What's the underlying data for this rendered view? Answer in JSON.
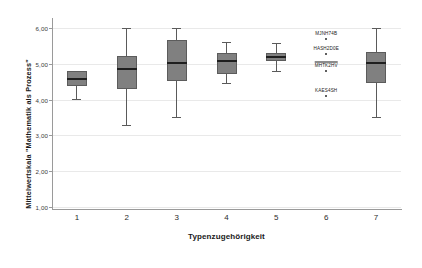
{
  "chart_data": {
    "type": "box",
    "title": "",
    "xlabel": "Typenzugehörigkeit",
    "ylabel": "Mittelwertskala \"Mathematik als Prozess\"",
    "categories": [
      "1",
      "2",
      "3",
      "4",
      "5",
      "6",
      "7"
    ],
    "ytick_labels": [
      "6,00",
      "5,00",
      "4,00",
      "3,00",
      "2,00",
      "1,00"
    ],
    "ytick_values": [
      6.0,
      5.0,
      4.0,
      3.0,
      2.0,
      1.0
    ],
    "ylim": [
      1.0,
      6.2
    ],
    "grid": true,
    "legend": "none",
    "boxes": [
      {
        "category": "1",
        "whisker_low": 4.02,
        "q1": 4.38,
        "median": 4.58,
        "q3": 4.8,
        "whisker_high": 4.8
      },
      {
        "category": "2",
        "whisker_low": 3.28,
        "q1": 4.3,
        "median": 4.87,
        "q3": 5.22,
        "whisker_high": 6.0
      },
      {
        "category": "3",
        "whisker_low": 3.52,
        "q1": 4.52,
        "median": 5.02,
        "q3": 5.68,
        "whisker_high": 6.0
      },
      {
        "category": "4",
        "whisker_low": 4.46,
        "q1": 4.72,
        "median": 5.08,
        "q3": 5.3,
        "whisker_high": 5.6
      },
      {
        "category": "5",
        "whisker_low": 4.8,
        "q1": 5.08,
        "median": 5.18,
        "q3": 5.3,
        "whisker_high": 5.58
      },
      {
        "category": "7",
        "whisker_low": 3.52,
        "q1": 4.48,
        "median": 5.02,
        "q3": 5.32,
        "whisker_high": 6.0
      }
    ],
    "outliers": [
      {
        "category": "6",
        "value": 5.72,
        "label": "MJNH74B",
        "overline": false
      },
      {
        "category": "6",
        "value": 5.3,
        "label": "HASH2D0E",
        "overline": false
      },
      {
        "category": "6",
        "value": 4.84,
        "label": "MHTK2HV",
        "overline": true
      },
      {
        "category": "6",
        "value": 4.14,
        "label": "KAES4SH",
        "overline": false
      }
    ],
    "colors": {
      "box_fill": "#808080",
      "box_edge": "#5c5c5c",
      "median": "#1f1f1f",
      "whisker": "#5a5a5a",
      "gridline": "#e9e9e9",
      "axis": "#9a9a9a",
      "background": "#ffffff",
      "text": "#1a1a1a"
    }
  }
}
